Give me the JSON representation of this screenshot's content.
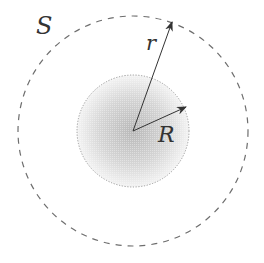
{
  "diagram": {
    "type": "concentric-circles",
    "labels": {
      "surface": "S",
      "radius_outer_vector": "r",
      "radius_inner": "R"
    },
    "colors": {
      "outer_dashed": "#6e6e6e",
      "inner_dotted": "#9a9a9a",
      "shade_center": "#bdbdbd",
      "shade_edge": "#f4f4f4",
      "arrow": "#333333",
      "text": "#333333"
    },
    "geometry": {
      "center": [
        133,
        131
      ],
      "outer_radius": 115,
      "inner_radius": 56,
      "r_arrow_tip": [
        172,
        22
      ],
      "R_arrow_tip": [
        186,
        107
      ]
    }
  }
}
